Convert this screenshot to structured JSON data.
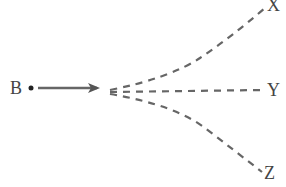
{
  "diagram": {
    "source": {
      "label": "B"
    },
    "targets": [
      {
        "label": "X"
      },
      {
        "label": "Y"
      },
      {
        "label": "Z"
      }
    ],
    "colors": {
      "line": "#555555",
      "text": "#444444"
    }
  }
}
